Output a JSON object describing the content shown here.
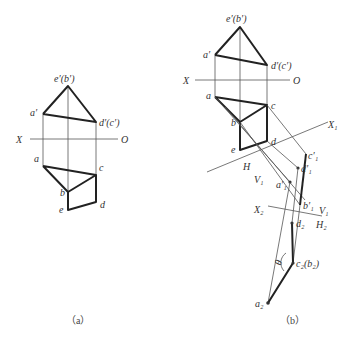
{
  "figure_a": {
    "caption": "（a）",
    "labels": {
      "e_prime_b_prime": "e′(b′)",
      "a_prime": "a′",
      "d_prime_c_prime": "d′(c′)",
      "X": "X",
      "O": "O",
      "a": "a",
      "b": "b",
      "c": "c",
      "d": "d",
      "e": "e"
    }
  },
  "figure_b": {
    "caption": "（b）",
    "labels": {
      "e_prime_b_prime": "e′(b′)",
      "a_prime": "a′",
      "d_prime_c_prime": "d′(c′)",
      "X": "X",
      "O": "O",
      "a": "a",
      "b": "b",
      "c": "c",
      "d": "d",
      "e": "e",
      "X1": "X₁",
      "H": "H",
      "V1": "V₁",
      "c1p": "c′₁",
      "d1p": "d′₁",
      "a1p": "a′₁",
      "b1p": "b′₁",
      "X2": "X₂",
      "V1b": "V₁",
      "H2": "H₂",
      "d2": "d₂",
      "c2b2": "c₂(b₂)",
      "a2": "a₂",
      "theta": "θ"
    }
  }
}
